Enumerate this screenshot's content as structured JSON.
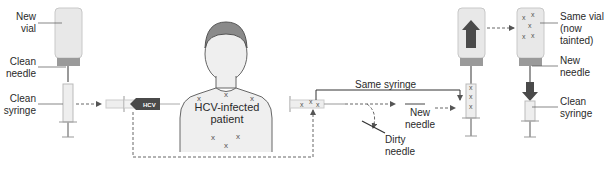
{
  "labels": {
    "new_vial": [
      "New",
      "vial"
    ],
    "clean_needle_left": [
      "Clean",
      "needle"
    ],
    "clean_syringe_left": [
      "Clean",
      "syringe"
    ],
    "patient": [
      "HCV-infected",
      "patient"
    ],
    "same_syringe": "Same syringe",
    "new_needle_mid": [
      "New",
      "needle"
    ],
    "dirty_needle": [
      "Dirty",
      "needle"
    ],
    "same_vial": [
      "Same vial",
      "(now tainted)"
    ],
    "new_needle_right": [
      "New",
      "needle"
    ],
    "clean_syringe_right": [
      "Clean",
      "syringe"
    ]
  },
  "badges": {
    "hcv_left": "HCV",
    "hcv_vial": "HCV",
    "hcv_syringe_right": "HCV"
  },
  "markers": {
    "contamination": "x"
  },
  "colors": {
    "hcv_badge": "#4a4a4a",
    "skin": "#ececec",
    "hair": "#8a8a8a",
    "dashed_line": "#666666",
    "vial": "#e6e6e6",
    "cap": "#9a9a9a"
  }
}
